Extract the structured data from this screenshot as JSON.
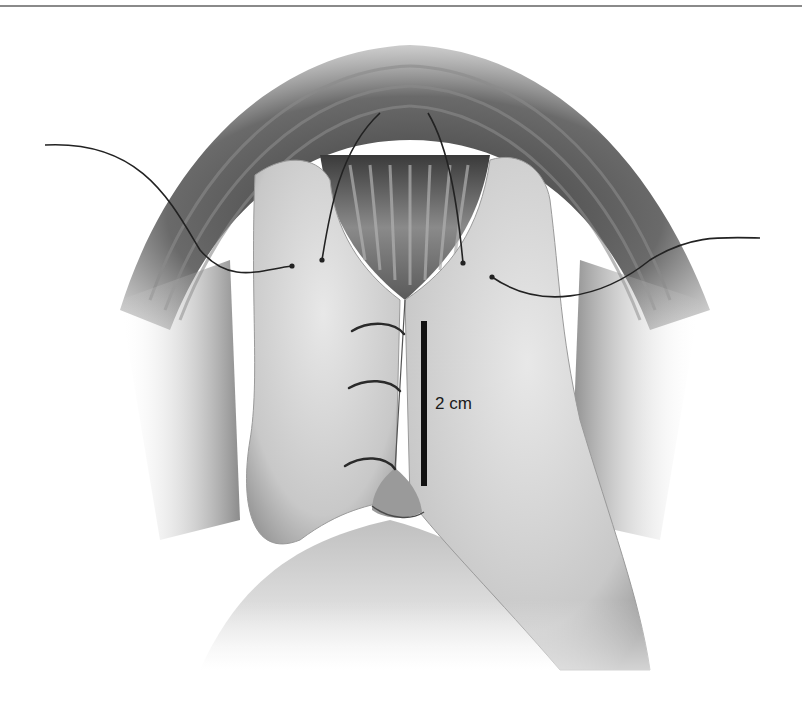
{
  "figure": {
    "style": "grayscale airbrushed medical illustration",
    "colors": {
      "background": "#ffffff",
      "rule": "#8a8a8a",
      "tissue_light": "#e2e2e2",
      "tissue_mid": "#b8b8b8",
      "tissue_dark": "#5a5a5a",
      "suture": "#2a2a2a",
      "scale_bar": "#111111"
    },
    "scale_bar": {
      "label": "2 cm",
      "x": 425,
      "y_top": 321,
      "y_bottom": 486
    },
    "sutures": {
      "interrupted_stitches": 3,
      "stay_sutures": 4
    }
  }
}
